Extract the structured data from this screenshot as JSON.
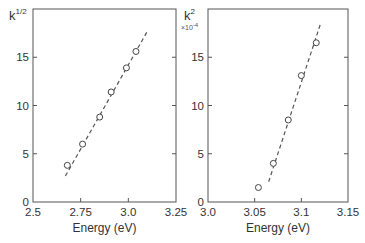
{
  "chart_data": [
    {
      "type": "scatter",
      "panel": "left",
      "title": "",
      "xlabel": "Energy (eV)",
      "ylabel": "k^1/2",
      "ylabel_base": "k",
      "ylabel_sup": "1/2",
      "xlim": [
        2.5,
        3.25
      ],
      "ylim": [
        0,
        20
      ],
      "xticks": [
        "2.5",
        "2.75",
        "3.0",
        "3.25"
      ],
      "yticks": [
        "0",
        "5",
        "10",
        "15"
      ],
      "grid": false,
      "series": [
        {
          "name": "data",
          "marker": "open-circle",
          "x": [
            2.68,
            2.76,
            2.85,
            2.91,
            2.99,
            3.04
          ],
          "y": [
            3.8,
            6.0,
            8.8,
            11.4,
            13.9,
            15.6
          ]
        },
        {
          "name": "linear fit",
          "style": "dashed",
          "x": [
            2.67,
            3.1
          ],
          "y": [
            2.7,
            17.7
          ]
        }
      ]
    },
    {
      "type": "scatter",
      "panel": "right",
      "title": "",
      "xlabel": "Energy (eV)",
      "ylabel": "k^2 ×10^-4",
      "ylabel_base": "k",
      "ylabel_sup": "2",
      "ylabel_multiplier": "×10",
      "ylabel_multiplier_exp": "-4",
      "xlim": [
        3.0,
        3.15
      ],
      "ylim": [
        0,
        20
      ],
      "xticks": [
        "3.0",
        "3.05",
        "3.1",
        "3.15"
      ],
      "yticks": [
        "0",
        "5",
        "10",
        "15"
      ],
      "grid": false,
      "series": [
        {
          "name": "data",
          "marker": "open-circle",
          "x": [
            3.054,
            3.07,
            3.086,
            3.1,
            3.116
          ],
          "y": [
            1.5,
            4.0,
            8.5,
            13.1,
            16.5
          ]
        },
        {
          "name": "linear fit",
          "style": "dashed",
          "x": [
            3.065,
            3.121
          ],
          "y": [
            2.1,
            18.6
          ]
        }
      ]
    }
  ],
  "colors": {
    "axis": "#555555",
    "text": "#333333",
    "marker_edge": "#444444",
    "fit_line": "#555555",
    "background": "#ffffff"
  }
}
